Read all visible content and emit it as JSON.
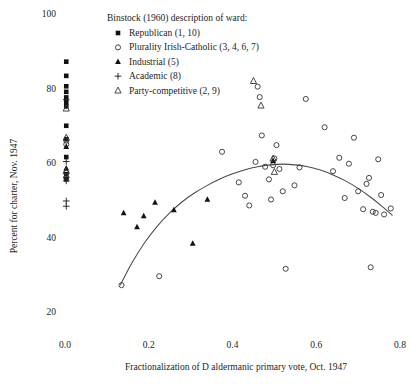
{
  "chart_data": {
    "type": "scatter",
    "title": "",
    "xlabel": "Fractionalization of D aldermanic primary vote, Oct. 1947",
    "ylabel": "Percent for charter, Nov. 1947",
    "xlim": [
      -0.035,
      0.84
    ],
    "ylim": [
      17.0,
      101.5
    ],
    "xticks": [
      0.0,
      0.2,
      0.4,
      0.6,
      0.8
    ],
    "xtick_labels": [
      "0.0",
      "0.2",
      "0.4",
      "0.6",
      "0.8"
    ],
    "yticks": [
      20,
      40,
      60,
      80,
      100
    ],
    "ytick_labels": [
      "20",
      "40",
      "60",
      "80",
      "100"
    ],
    "grid": false,
    "legend_position": "top-center",
    "legend_title": "Binstock (1960) description of ward:",
    "series": [
      {
        "name": "Republican (1, 10)",
        "marker": "filled-square",
        "points": [
          [
            0.003,
            87.2
          ],
          [
            0.003,
            83.4
          ],
          [
            0.003,
            80.6
          ],
          [
            0.003,
            79.1
          ],
          [
            0.003,
            77.6
          ],
          [
            0.003,
            76.3
          ],
          [
            0.003,
            75.2
          ],
          [
            0.003,
            70.0
          ],
          [
            0.003,
            66.4
          ],
          [
            0.003,
            61.6
          ],
          [
            0.003,
            57.0
          ],
          [
            0.003,
            55.6
          ]
        ]
      },
      {
        "name": "Plurality Irish-Catholic (3, 4, 6, 7)",
        "marker": "open-circle",
        "points": [
          [
            0.003,
            66.0
          ],
          [
            0.003,
            65.0
          ],
          [
            0.003,
            57.4
          ],
          [
            0.003,
            56.0
          ],
          [
            0.135,
            27.2
          ],
          [
            0.225,
            29.6
          ],
          [
            0.375,
            63.0
          ],
          [
            0.415,
            54.8
          ],
          [
            0.43,
            51.2
          ],
          [
            0.44,
            48.6
          ],
          [
            0.455,
            60.3
          ],
          [
            0.46,
            80.5
          ],
          [
            0.465,
            77.7
          ],
          [
            0.47,
            67.4
          ],
          [
            0.478,
            59.0
          ],
          [
            0.487,
            55.6
          ],
          [
            0.492,
            50.2
          ],
          [
            0.497,
            59.4
          ],
          [
            0.5,
            61.2
          ],
          [
            0.505,
            64.8
          ],
          [
            0.512,
            58.4
          ],
          [
            0.52,
            52.4
          ],
          [
            0.527,
            31.6
          ],
          [
            0.548,
            54.0
          ],
          [
            0.56,
            58.8
          ],
          [
            0.575,
            77.2
          ],
          [
            0.62,
            69.6
          ],
          [
            0.64,
            57.8
          ],
          [
            0.655,
            61.4
          ],
          [
            0.668,
            50.6
          ],
          [
            0.678,
            59.8
          ],
          [
            0.69,
            66.8
          ],
          [
            0.7,
            52.4
          ],
          [
            0.712,
            47.6
          ],
          [
            0.72,
            54.4
          ],
          [
            0.726,
            56.0
          ],
          [
            0.73,
            32.0
          ],
          [
            0.735,
            46.9
          ],
          [
            0.742,
            46.6
          ],
          [
            0.748,
            61.0
          ],
          [
            0.755,
            51.4
          ],
          [
            0.762,
            46.2
          ],
          [
            0.778,
            47.8
          ]
        ]
      },
      {
        "name": "Industrial (5)",
        "marker": "filled-triangle",
        "points": [
          [
            0.003,
            64.4
          ],
          [
            0.003,
            58.6
          ],
          [
            0.14,
            46.6
          ],
          [
            0.172,
            42.8
          ],
          [
            0.188,
            45.8
          ],
          [
            0.215,
            49.4
          ],
          [
            0.26,
            47.4
          ],
          [
            0.305,
            38.4
          ],
          [
            0.34,
            50.2
          ],
          [
            0.497,
            60.6
          ]
        ]
      },
      {
        "name": "Academic (8)",
        "marker": "plus",
        "points": [
          [
            0.003,
            77.0
          ],
          [
            0.003,
            60.4
          ],
          [
            0.003,
            56.2
          ],
          [
            0.003,
            55.2
          ],
          [
            0.003,
            49.8
          ],
          [
            0.003,
            48.4
          ]
        ]
      },
      {
        "name": "Party-competitive (2, 9)",
        "marker": "open-triangle",
        "points": [
          [
            0.003,
            74.6
          ],
          [
            0.003,
            66.8
          ],
          [
            0.003,
            57.8
          ],
          [
            0.45,
            82.0
          ],
          [
            0.468,
            75.4
          ],
          [
            0.497,
            61.2
          ],
          [
            0.5,
            57.6
          ]
        ]
      }
    ],
    "fit_curve": {
      "label": "lowess fit",
      "points": [
        [
          0.132,
          27.2
        ],
        [
          0.16,
          33.2
        ],
        [
          0.19,
          38.6
        ],
        [
          0.22,
          43.0
        ],
        [
          0.25,
          46.6
        ],
        [
          0.28,
          49.6
        ],
        [
          0.31,
          52.0
        ],
        [
          0.34,
          54.0
        ],
        [
          0.37,
          55.7
        ],
        [
          0.4,
          57.1
        ],
        [
          0.43,
          58.2
        ],
        [
          0.46,
          59.0
        ],
        [
          0.49,
          59.5
        ],
        [
          0.52,
          59.7
        ],
        [
          0.55,
          59.5
        ],
        [
          0.58,
          59.0
        ],
        [
          0.61,
          58.1
        ],
        [
          0.64,
          56.8
        ],
        [
          0.67,
          55.2
        ],
        [
          0.7,
          53.2
        ],
        [
          0.73,
          50.8
        ],
        [
          0.76,
          48.1
        ],
        [
          0.782,
          45.9
        ]
      ]
    }
  }
}
